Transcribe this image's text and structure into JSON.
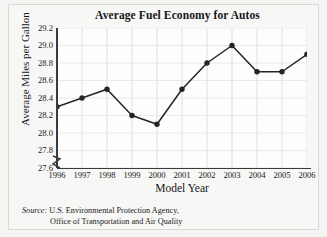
{
  "chart_data": {
    "type": "line",
    "title": "Average Fuel Economy for Autos",
    "xlabel": "Model Year",
    "ylabel": "Average Miles per Gallon",
    "categories": [
      1996,
      1997,
      1998,
      1999,
      2000,
      2001,
      2002,
      2003,
      2004,
      2005,
      2006
    ],
    "x_tick_labels": [
      "1996",
      "1997",
      "1998",
      "1999",
      "2000",
      "2001",
      "2002",
      "2003",
      "2004",
      "2005",
      "2006"
    ],
    "values": [
      28.3,
      28.4,
      28.5,
      28.2,
      28.1,
      28.5,
      28.8,
      29.0,
      28.7,
      28.7,
      28.9
    ],
    "y_tick_labels": [
      "29.2",
      "29.0",
      "28.8",
      "28.6",
      "28.4",
      "28.2",
      "28.0",
      "27.8",
      "27.6"
    ],
    "y_ticks": [
      29.2,
      29.0,
      28.8,
      28.6,
      28.4,
      28.2,
      28.0,
      27.8,
      27.6
    ],
    "ylim": [
      27.6,
      29.2
    ],
    "xlim": [
      1996,
      2006
    ],
    "grid": true,
    "legend": "none",
    "axis_break": true,
    "series_color": "#242424",
    "marker": "filled-circle"
  },
  "source": {
    "label": "Source:",
    "line1": "U.S. Environmental Protection Agency,",
    "line2": "Office of Transportation and Air Quality"
  }
}
